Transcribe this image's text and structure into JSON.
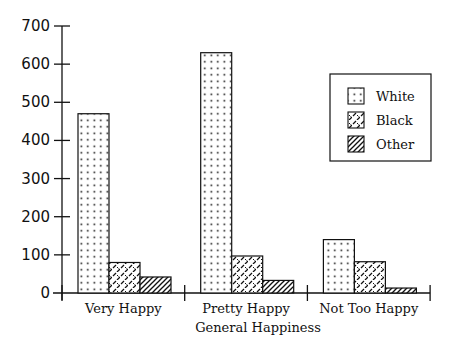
{
  "chart_data": {
    "type": "bar",
    "title": "",
    "xlabel": "General Happiness",
    "ylabel": "",
    "categories": [
      "Very Happy",
      "Pretty Happy",
      "Not Too Happy"
    ],
    "series": [
      {
        "name": "White",
        "pattern": "dots",
        "values": [
          470,
          630,
          140
        ]
      },
      {
        "name": "Black",
        "pattern": "dashed-diagonal",
        "values": [
          80,
          97,
          82
        ]
      },
      {
        "name": "Other",
        "pattern": "diagonal-hatch",
        "values": [
          42,
          33,
          13
        ]
      }
    ],
    "ylim": [
      0,
      700
    ],
    "yticks": [
      0,
      100,
      200,
      300,
      400,
      500,
      600,
      700
    ],
    "grid": false,
    "legend_position": "upper right",
    "colors": {
      "ink": "#111111",
      "background": "#ffffff"
    }
  }
}
